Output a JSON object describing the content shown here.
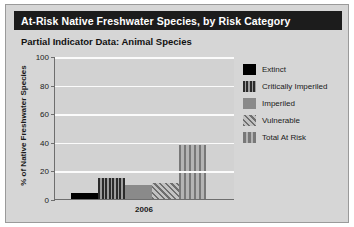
{
  "panel": {
    "title": "At-Risk Native Freshwater Species, by Risk Category",
    "subtitle": "Partial Indicator Data: Animal Species"
  },
  "colors": {
    "title_bar_bg": "#1c1c1c",
    "title_text": "#ffffff",
    "panel_bg": "#d6d6d6",
    "plot_bg": "#d2d2d2",
    "gridline": "#fbfbfb",
    "axis": "#6e6e6e"
  },
  "legend": {
    "items": [
      {
        "label": "Extinct",
        "swatch": "p-solid-black"
      },
      {
        "label": "Critically Imperiled",
        "swatch": "p-vstripe-dark"
      },
      {
        "label": "Imperiled",
        "swatch": "p-solid-gray"
      },
      {
        "label": "Vulnerable",
        "swatch": "p-diag"
      },
      {
        "label": "Total At Risk",
        "swatch": "p-vstripe-gray"
      }
    ]
  },
  "chart_data": {
    "type": "bar",
    "title": "At-Risk Native Freshwater Species, by Risk Category",
    "subtitle": "Partial Indicator Data: Animal Species",
    "xlabel": "2006",
    "ylabel": "% of Native Freshwater Species",
    "categories": [
      "2006"
    ],
    "ylim": [
      0,
      100
    ],
    "yticks": [
      0,
      20,
      40,
      60,
      80,
      100
    ],
    "ytick_labels": [
      "0",
      "20",
      "40",
      "60",
      "80",
      "100"
    ],
    "grid": true,
    "legend_position": "right",
    "series": [
      {
        "name": "Extinct",
        "values": [
          4
        ],
        "swatch": "p-solid-black"
      },
      {
        "name": "Critically Imperiled",
        "values": [
          15
        ],
        "swatch": "p-vstripe-dark"
      },
      {
        "name": "Imperiled",
        "values": [
          10
        ],
        "swatch": "p-solid-gray"
      },
      {
        "name": "Vulnerable",
        "values": [
          11
        ],
        "swatch": "p-diag"
      },
      {
        "name": "Total At Risk",
        "values": [
          38
        ],
        "swatch": "p-vstripe-gray"
      }
    ]
  }
}
